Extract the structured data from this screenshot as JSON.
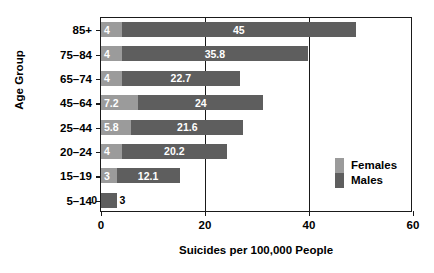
{
  "chart_data": {
    "type": "bar",
    "orientation": "horizontal",
    "stacked": true,
    "title": "",
    "xlabel": "Suicides per 100,000 People",
    "ylabel": "Age Group",
    "categories": [
      "85+",
      "75–84",
      "65–74",
      "45–64",
      "25–44",
      "20–24",
      "15–19",
      "5–14"
    ],
    "series": [
      {
        "name": "Females",
        "color": "#9b9b9b",
        "values": [
          4,
          4,
          4,
          7.2,
          5.8,
          4,
          3,
          0
        ]
      },
      {
        "name": "Males",
        "color": "#5e5e5e",
        "values": [
          45,
          35.8,
          22.7,
          24,
          21.6,
          20.2,
          12.1,
          3
        ]
      }
    ],
    "value_labels": {
      "Females": [
        "4",
        "4",
        "4",
        "7.2",
        "5.8",
        "4",
        "3",
        "0"
      ],
      "Males": [
        "45",
        "35.8",
        "22.7",
        "24",
        "21.6",
        "20.2",
        "12.1",
        "3"
      ]
    },
    "xlim": [
      0,
      60
    ],
    "xticks": [
      0,
      20,
      40,
      60
    ],
    "xticklabels": [
      "0",
      "20",
      "40",
      "60"
    ],
    "grid": "vertical-at-ticks",
    "legend": {
      "position": "inside-right",
      "entries": [
        {
          "label": "Females",
          "color": "#9b9b9b"
        },
        {
          "label": "Males",
          "color": "#5e5e5e"
        }
      ]
    },
    "colors": {
      "females": "#9b9b9b",
      "males": "#5e5e5e",
      "axis": "#1a1a1a",
      "background": "#ffffff",
      "label_text": "#ffffff"
    }
  }
}
